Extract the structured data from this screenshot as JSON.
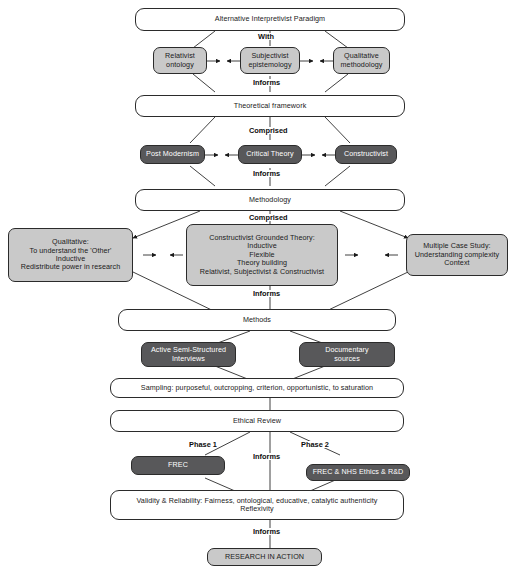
{
  "diagram": {
    "colors": {
      "light_grey_fill": "#c9c9c9",
      "dark_grey_fill": "#58585a",
      "white_fill": "#ffffff",
      "line": "#2b2b2b",
      "text_dark": "#1a1a1a",
      "text_light": "#ffffff"
    },
    "nodes": {
      "paradigm": "Alternative Interpretivist Paradigm",
      "relativist_ontology": "Relativist\nontology",
      "subjectivist_epistemology": "Subjectivist\nepistemology",
      "qualitative_methodology": "Qualitative\nmethodology",
      "theoretical_framework": "Theoretical framework",
      "post_modernism": "Post Modernism",
      "critical_theory": "Critical Theory",
      "constructivist": "Constructivist",
      "methodology": "Methodology",
      "qualitative_detail": "Qualitative:\nTo understand the 'Other'\nInductive\nRedistribute power in research",
      "cgt_detail": "Constructivist Grounded Theory:\nInductive\nFlexible\nTheory building\nRelativist, Subjectivist & Constructivist",
      "multiple_case_study": "Multiple Case Study:\nUnderstanding complexity\nContext",
      "methods": "Methods",
      "interviews": "Active Semi-Structured\nInterviews",
      "documentary_sources": "Documentary\nsources",
      "sampling": "Sampling: purposeful, outcropping, criterion, opportunistic, to saturation",
      "ethical_review": "Ethical Review",
      "frec": "FREC",
      "frec_nhs": "FREC & NHS Ethics & R&D",
      "validity": "Validity & Reliability: Fairness, ontological, educative, catalytic authenticity\nReflexivity",
      "research_in_action": "RESEARCH IN ACTION"
    },
    "connector_labels": {
      "with": "With",
      "informs_1": "Informs",
      "comprised_1": "Comprised",
      "informs_2": "Informs",
      "comprised_2": "Comprised",
      "informs_3": "Informs",
      "informs_4": "Informs",
      "informs_5": "Informs"
    },
    "phase_labels": {
      "phase_1": "Phase 1",
      "phase_2": "Phase 2"
    }
  }
}
